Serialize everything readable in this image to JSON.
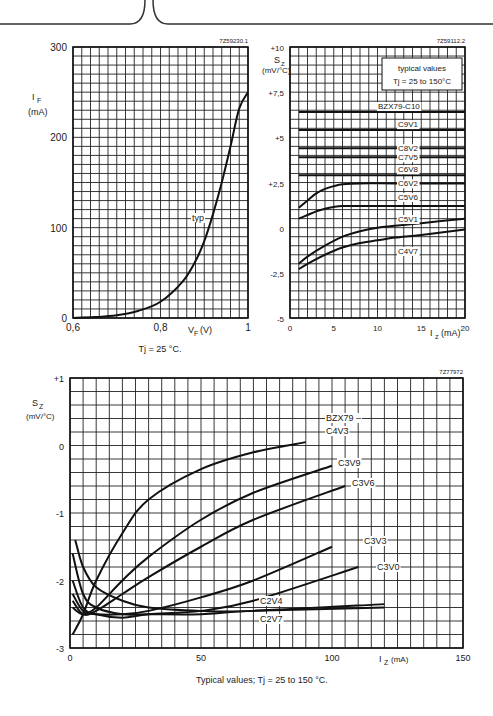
{
  "header": {
    "decor": "page-tab-border"
  },
  "chart_data": [
    {
      "id": "forward-characteristic",
      "type": "line",
      "figure_code": "7Z59230.1",
      "title": "",
      "xlabel": "V_F (V)",
      "ylabel": "I_F (mA)",
      "xlim": [
        0.6,
        1.0
      ],
      "ylim": [
        0,
        300
      ],
      "x_ticks": [
        "0,6",
        "0,8",
        "1"
      ],
      "y_ticks": [
        "0",
        "100",
        "200",
        "300"
      ],
      "grid": true,
      "caption": "T_j = 25 °C.",
      "series": [
        {
          "name": "typ",
          "x": [
            0.6,
            0.65,
            0.7,
            0.75,
            0.8,
            0.85,
            0.88,
            0.9,
            0.92,
            0.94,
            0.96,
            0.98,
            1.0
          ],
          "y": [
            0,
            1,
            3,
            8,
            18,
            40,
            63,
            85,
            115,
            150,
            190,
            232,
            250
          ]
        }
      ]
    },
    {
      "id": "temp-coefficient-high",
      "type": "line",
      "figure_code": "7Z59112.2",
      "xlabel": "I_Z (mA)",
      "ylabel": "S_Z (mV/°C)",
      "xlim": [
        0,
        20
      ],
      "ylim": [
        -5,
        10
      ],
      "x_ticks": [
        "0",
        "5",
        "10",
        "15",
        "20"
      ],
      "y_ticks": [
        "-5",
        "-2,5",
        "0",
        "+2,5",
        "+5",
        "+7,5",
        "+10"
      ],
      "grid": true,
      "legend_box": [
        "typical values",
        "T_j = 25 to 150°C"
      ],
      "series": [
        {
          "name": "BZX79-C10",
          "x": [
            1,
            20
          ],
          "y": [
            6.4,
            6.4
          ]
        },
        {
          "name": "C9V1",
          "x": [
            1,
            20
          ],
          "y": [
            5.4,
            5.4
          ]
        },
        {
          "name": "C8V2",
          "x": [
            1,
            20
          ],
          "y": [
            4.4,
            4.4
          ]
        },
        {
          "name": "C7V5",
          "x": [
            1,
            20
          ],
          "y": [
            3.9,
            3.9
          ]
        },
        {
          "name": "C6V8",
          "x": [
            1,
            20
          ],
          "y": [
            2.9,
            2.9
          ]
        },
        {
          "name": "C6V2",
          "x": [
            1,
            2,
            3,
            4,
            5,
            6,
            8,
            12,
            20
          ],
          "y": [
            1.1,
            1.5,
            1.9,
            2.15,
            2.3,
            2.4,
            2.45,
            2.45,
            2.45
          ]
        },
        {
          "name": "C5V6",
          "x": [
            1,
            2,
            3,
            4,
            5,
            6,
            8,
            12,
            20
          ],
          "y": [
            0.5,
            0.7,
            0.9,
            1.05,
            1.15,
            1.2,
            1.2,
            1.2,
            1.2
          ]
        },
        {
          "name": "C5V1",
          "x": [
            1,
            2,
            4,
            6,
            8,
            10,
            12,
            15,
            20
          ],
          "y": [
            -2.0,
            -1.6,
            -1.0,
            -0.5,
            -0.2,
            0.0,
            0.1,
            0.25,
            0.5
          ]
        },
        {
          "name": "C4V7",
          "x": [
            1,
            2,
            4,
            6,
            8,
            10,
            12,
            15,
            20
          ],
          "y": [
            -2.3,
            -2.0,
            -1.5,
            -1.1,
            -0.85,
            -0.7,
            -0.55,
            -0.4,
            -0.1
          ]
        }
      ]
    },
    {
      "id": "temp-coefficient-low",
      "type": "line",
      "figure_code": "7Z77972",
      "xlabel": "I_Z (mA)",
      "ylabel": "S_Z (mV/°C)",
      "xlim": [
        0,
        150
      ],
      "ylim": [
        -3,
        1
      ],
      "x_ticks": [
        "0",
        "50",
        "100",
        "150"
      ],
      "y_ticks": [
        "-3",
        "-2",
        "-1",
        "0",
        "+1"
      ],
      "grid": true,
      "caption": "Typical values; T_j = 25 to 150 °C.",
      "series": [
        {
          "name": "BZX79-C4V3",
          "x": [
            1,
            5,
            10,
            20,
            30,
            50,
            70,
            90
          ],
          "y": [
            -2.8,
            -2.5,
            -2.0,
            -1.3,
            -0.8,
            -0.35,
            -0.1,
            0.05
          ]
        },
        {
          "name": "C3V9",
          "x": [
            1,
            5,
            10,
            20,
            30,
            50,
            70,
            100
          ],
          "y": [
            -2.4,
            -2.5,
            -2.4,
            -2.0,
            -1.65,
            -1.1,
            -0.7,
            -0.3
          ]
        },
        {
          "name": "C3V6",
          "x": [
            1,
            5,
            10,
            20,
            30,
            50,
            70,
            105
          ],
          "y": [
            -2.3,
            -2.5,
            -2.45,
            -2.2,
            -1.95,
            -1.5,
            -1.1,
            -0.6
          ]
        },
        {
          "name": "C3V3",
          "x": [
            1,
            5,
            10,
            20,
            30,
            50,
            70,
            100
          ],
          "y": [
            -2.2,
            -2.45,
            -2.5,
            -2.5,
            -2.45,
            -2.25,
            -2.0,
            -1.5
          ]
        },
        {
          "name": "C3V0",
          "x": [
            1,
            5,
            10,
            20,
            30,
            50,
            70,
            110
          ],
          "y": [
            -2.0,
            -2.4,
            -2.5,
            -2.55,
            -2.5,
            -2.45,
            -2.3,
            -1.8
          ]
        },
        {
          "name": "C2V7",
          "x": [
            1,
            5,
            10,
            20,
            30,
            50,
            70,
            120
          ],
          "y": [
            -1.6,
            -2.2,
            -2.4,
            -2.5,
            -2.5,
            -2.5,
            -2.45,
            -2.4
          ]
        },
        {
          "name": "C2V4",
          "x": [
            2,
            5,
            10,
            20,
            30,
            50,
            70,
            120
          ],
          "y": [
            -1.4,
            -1.8,
            -2.1,
            -2.3,
            -2.4,
            -2.45,
            -2.45,
            -2.35
          ]
        }
      ]
    }
  ]
}
